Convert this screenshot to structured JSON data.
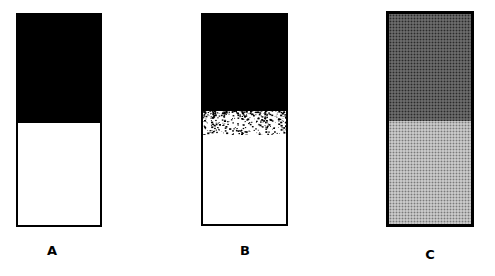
{
  "figure": {
    "panels": [
      {
        "id": "A",
        "label": "A",
        "description": "sharp black/white boundary",
        "top_color": "#000000",
        "bottom_color": "#ffffff"
      },
      {
        "id": "B",
        "label": "B",
        "description": "diffuse/ragged black/white boundary",
        "top_color": "#000000",
        "bottom_color": "#ffffff"
      },
      {
        "id": "C",
        "label": "C",
        "description": "dark stippled top, light stippled bottom",
        "top_color": "#555555",
        "bottom_color": "#b0b0b0"
      }
    ]
  }
}
